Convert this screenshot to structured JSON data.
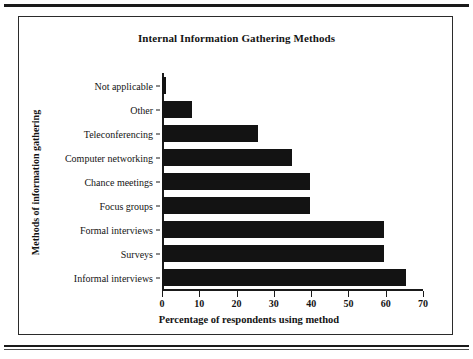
{
  "page": {
    "rules_visible": true
  },
  "chart_data": {
    "type": "bar",
    "orientation": "horizontal",
    "title": "Internal Information Gathering Methods",
    "xlabel": "Percentage of respondents using method",
    "ylabel": "Methods of information gathering",
    "categories": [
      "Not applicable",
      "Other",
      "Teleconferencing",
      "Computer networking",
      "Chance meetings",
      "Focus groups",
      "Formal interviews",
      "Surveys",
      "Informal interviews"
    ],
    "values": [
      1,
      8,
      26,
      35,
      40,
      40,
      60,
      60,
      66
    ],
    "xlim": [
      0,
      70
    ],
    "xticks": [
      0,
      10,
      20,
      30,
      40,
      50,
      60,
      70
    ],
    "xtick_labels": [
      "0",
      "10",
      "20",
      "30",
      "40",
      "50",
      "60",
      "70"
    ],
    "grid": false,
    "legend": false,
    "bar_color": "#131313",
    "background": "#ffffff"
  }
}
